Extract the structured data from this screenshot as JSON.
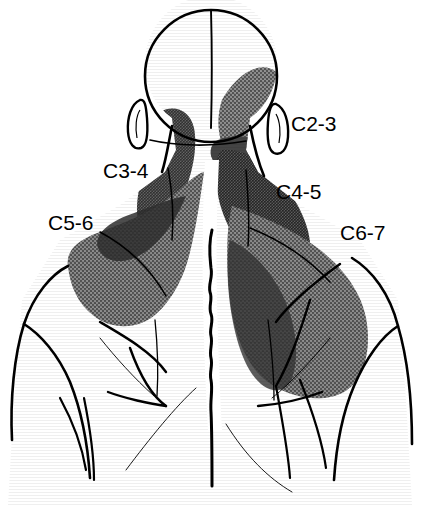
{
  "figure": {
    "view": "posterior",
    "width": 431,
    "height": 505,
    "background_color": "#ffffff",
    "line_color": "#000000"
  },
  "labels": [
    {
      "id": "c2-3",
      "text": "C2-3",
      "side": "right",
      "region": "suboccipital / posterior head",
      "x": 291,
      "y": 113
    },
    {
      "id": "c3-4",
      "text": "C3-4",
      "side": "left",
      "region": "posterolateral neck",
      "x": 103,
      "y": 160
    },
    {
      "id": "c4-5",
      "text": "C4-5",
      "side": "right",
      "region": "supraspinous / upper trapezius",
      "x": 276,
      "y": 181
    },
    {
      "id": "c5-6",
      "text": "C5-6",
      "side": "left",
      "region": "superior shoulder / acromion",
      "x": 48,
      "y": 212
    },
    {
      "id": "c6-7",
      "text": "C6-7",
      "side": "right",
      "region": "scapular / interscapular",
      "x": 340,
      "y": 222
    }
  ],
  "shading": {
    "light_gray": "#8d8d8d",
    "mid_gray": "#6e6e6e",
    "dark_gray": "#4a4a4a",
    "darkest_gray": "#303030",
    "description": "Overlapping stippled gray pain-referral fields; darker tone indicates overlap of adjacent segmental patterns."
  },
  "anatomy_parts": [
    {
      "name": "head-outline",
      "description": "posterior cranium circle"
    },
    {
      "name": "head-midline",
      "description": "vertical sagittal midline of skull"
    },
    {
      "name": "left-ear",
      "description": "outlined auricle, subject's right ear on viewer left"
    },
    {
      "name": "right-ear",
      "description": "outlined auricle, subject's left ear on viewer right"
    },
    {
      "name": "neck-outline",
      "description": "posterior neck borders"
    },
    {
      "name": "spine-line",
      "description": "wavy vertebral spinous process line"
    },
    {
      "name": "left-shoulder-outline",
      "description": "deltoid and upper arm contour"
    },
    {
      "name": "right-shoulder-outline",
      "description": "deltoid and upper arm contour"
    },
    {
      "name": "scapular-borders",
      "description": "medial and lateral scapular contour lines"
    },
    {
      "name": "torso-outline",
      "description": "upper back and flank contours"
    }
  ],
  "shaded_regions": [
    {
      "name": "c2-3-field",
      "label_ref": "c2-3",
      "tone": "mid_gray",
      "location": "right occipital region extending to ear"
    },
    {
      "name": "c3-4-field",
      "label_ref": "c3-4",
      "tone": "dark_gray",
      "location": "left posterolateral neck column"
    },
    {
      "name": "c4-5-field",
      "label_ref": "c4-5",
      "tone": "darkest_gray",
      "location": "right suprascapular / upper trapezius"
    },
    {
      "name": "c5-6-field",
      "label_ref": "c5-6",
      "tone": "mid_gray",
      "location": "left trapezius spreading to shoulder tip"
    },
    {
      "name": "c6-7-field",
      "label_ref": "c6-7",
      "tone": "mid_gray",
      "location": "right scapula and interscapular region"
    }
  ]
}
